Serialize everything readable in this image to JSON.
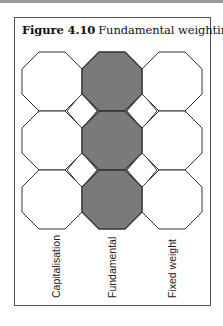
{
  "figure": {
    "number": "Figure 4.10",
    "title": "Fundamental weighting"
  },
  "colors": {
    "frame": "#555555",
    "outline": "#333333",
    "highlight_fill": "#7a7a7a",
    "plain_fill": "#ffffff"
  },
  "grid": {
    "rows": 3,
    "columns": [
      "Capitalisation",
      "Fundamental",
      "Fixed weight"
    ],
    "highlighted_column": "Fundamental"
  },
  "labels": {
    "col1": "Capitalisation",
    "col2": "Fundamental",
    "col3": "Fixed weight"
  }
}
